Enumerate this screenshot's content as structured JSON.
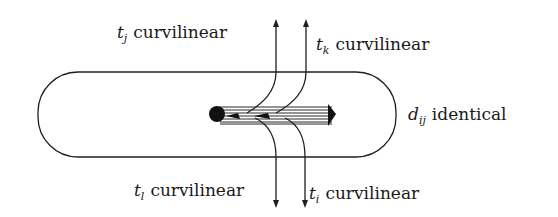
{
  "diagram": {
    "type": "schematic",
    "region": {
      "shape": "rounded-rectangle (stadium)",
      "x": 38,
      "y": 72,
      "width": 358,
      "height": 85,
      "label": {
        "symbol": "d",
        "subscript": "ij",
        "text": "identical"
      }
    },
    "bar": {
      "start_node": {
        "cx": 217,
        "cy": 114,
        "r": 8,
        "fill": "#111111"
      },
      "x1": 217,
      "x2": 334,
      "y_top": 106,
      "y_bottom": 124,
      "hatch_lines": 7,
      "end_cap": "arrow"
    },
    "paths": [
      {
        "id": "path-1",
        "top": {
          "symbol": "t",
          "subscript": "j",
          "text": "curvilinear",
          "direction": "up"
        },
        "bottom": {
          "symbol": "t",
          "subscript": "l",
          "text": "curvilinear",
          "direction": "down"
        },
        "x": 277
      },
      {
        "id": "path-2",
        "top": {
          "symbol": "t",
          "subscript": "k",
          "text": "curvilinear",
          "direction": "up"
        },
        "bottom": {
          "symbol": "t",
          "subscript": "i",
          "text": "curvilinear",
          "direction": "down"
        },
        "x": 306
      }
    ],
    "colors": {
      "ink": "#1f1f1f",
      "background": "#ffffff"
    }
  },
  "labels": {
    "tj": {
      "sym": "t",
      "sub": "j",
      "text": "curvilinear"
    },
    "tk": {
      "sym": "t",
      "sub": "k",
      "text": "curvilinear"
    },
    "tl": {
      "sym": "t",
      "sub": "l",
      "text": "curvilinear"
    },
    "ti": {
      "sym": "t",
      "sub": "i",
      "text": "curvilinear"
    },
    "dij": {
      "sym": "d",
      "sub": "ij",
      "text": "identical"
    }
  }
}
